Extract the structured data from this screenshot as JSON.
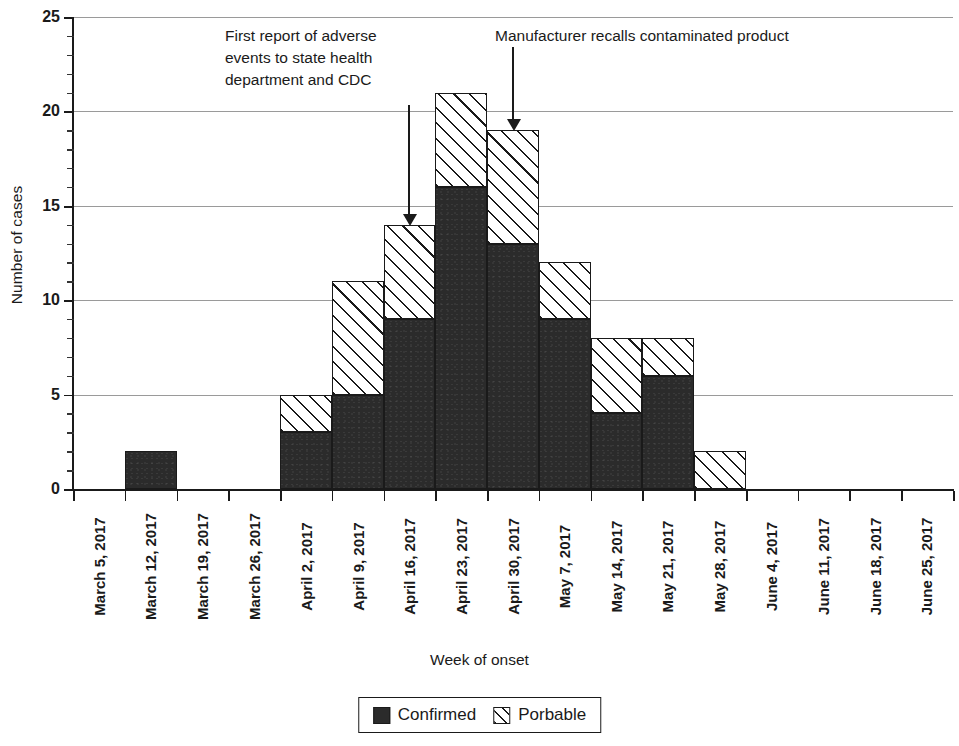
{
  "chart_data": {
    "type": "bar",
    "subtype": "stacked-histogram-epidemic-curve",
    "title": "",
    "xlabel": "Week of onset",
    "ylabel": "Number of cases",
    "ylim": [
      0,
      25
    ],
    "ytick_step_major": 5,
    "ytick_step_minor": 1,
    "grid": "horizontal-major",
    "legend_position": "bottom-center",
    "categories": [
      "March 5, 2017",
      "March 12, 2017",
      "March 19, 2017",
      "March 26, 2017",
      "April 2, 2017",
      "April 9, 2017",
      "April 16, 2017",
      "April 23, 2017",
      "April 30, 2017",
      "May 7, 2017",
      "May 14, 2017",
      "May 21, 2017",
      "May 28, 2017",
      "June 4, 2017",
      "June 11, 2017",
      "June 18, 2017",
      "June 25, 2017"
    ],
    "ytick_labels": [
      "0",
      "5",
      "10",
      "15",
      "20",
      "25"
    ],
    "ytick_values": [
      0,
      5,
      10,
      15,
      20,
      25
    ],
    "series": [
      {
        "name": "Confirmed",
        "fill": "solid-black",
        "color": "#2b2b2b",
        "values": [
          0,
          2,
          0,
          0,
          3,
          5,
          9,
          16,
          13,
          9,
          4,
          6,
          0,
          0,
          0,
          0,
          0
        ]
      },
      {
        "name": "Porbable",
        "fill": "diagonal-hatch",
        "color": "#ffffff",
        "values": [
          0,
          0,
          0,
          0,
          2,
          6,
          5,
          5,
          6,
          3,
          4,
          2,
          2,
          0,
          0,
          0,
          0
        ]
      }
    ],
    "totals": [
      0,
      2,
      0,
      0,
      5,
      11,
      14,
      21,
      19,
      12,
      8,
      8,
      2,
      0,
      0,
      0,
      0
    ],
    "annotations": [
      {
        "id": "first-report",
        "text": "First report of adverse\nevents to state health\ndepartment and CDC",
        "points_to_category": "April 16, 2017",
        "points_to_value": 14
      },
      {
        "id": "product-recall",
        "text": "Manufacturer recalls contaminated product",
        "points_to_category": "April 30, 2017",
        "points_to_value": 19
      }
    ]
  },
  "legend": {
    "items": [
      {
        "label": "Confirmed",
        "swatch": "solid-black-square"
      },
      {
        "label": "Porbable",
        "swatch": "diagonal-hatch-square"
      }
    ]
  },
  "colors": {
    "confirmed": "#2b2b2b",
    "probable_fill": "#ffffff",
    "stroke": "#1a1a1a",
    "gridline": "#9a9a9a",
    "background": "#ffffff"
  }
}
